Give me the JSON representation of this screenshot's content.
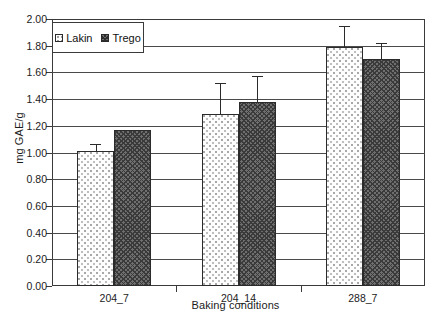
{
  "chart_data": {
    "type": "bar",
    "title": "",
    "xlabel": "Baking conditions",
    "ylabel": "mg GAE/g",
    "categories": [
      "204_7",
      "204_14",
      "288_7"
    ],
    "series": [
      {
        "name": "Lakin",
        "values": [
          1.01,
          1.29,
          1.79
        ],
        "errors_upper": [
          1.06,
          1.52,
          1.95
        ]
      },
      {
        "name": "Trego",
        "values": [
          1.17,
          1.38,
          1.7
        ],
        "errors_upper": [
          1.17,
          1.57,
          1.82
        ]
      }
    ],
    "ylim": [
      0.0,
      2.0
    ],
    "ytick_labels": [
      "0.00",
      "0.20",
      "0.40",
      "0.60",
      "0.80",
      "1.00",
      "1.20",
      "1.40",
      "1.60",
      "1.80",
      "2.00"
    ],
    "ytick_values": [
      0.0,
      0.2,
      0.4,
      0.6,
      0.8,
      1.0,
      1.2,
      1.4,
      1.6,
      1.8,
      2.0
    ],
    "grid": true,
    "legend_position": "top-left"
  },
  "legend": {
    "entries": [
      {
        "label": "Lakin",
        "swatch": "light-dotted-swatch"
      },
      {
        "label": "Trego",
        "swatch": "dark-hatched-swatch"
      }
    ]
  }
}
